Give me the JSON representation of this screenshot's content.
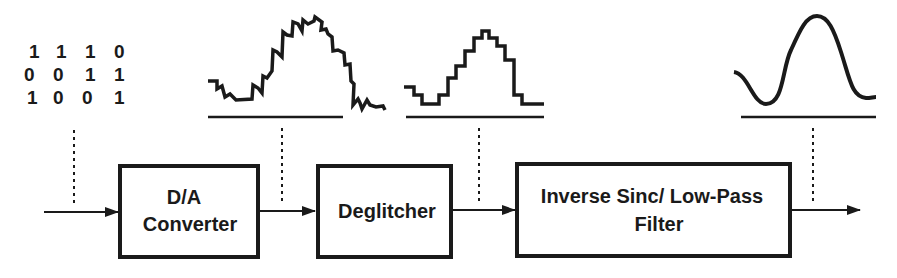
{
  "input_bits": {
    "rows": [
      [
        "1",
        "1",
        "1",
        "0"
      ],
      [
        "0",
        "0",
        "1",
        "1"
      ],
      [
        "1",
        "0",
        "0",
        "1"
      ]
    ]
  },
  "blocks": [
    {
      "id": "dac",
      "line1": "D/A",
      "line2": "Converter"
    },
    {
      "id": "deglitcher",
      "line1": "Deglitcher"
    },
    {
      "id": "filter",
      "line1": "Inverse Sinc/ Low-Pass",
      "line2": "Filter"
    }
  ],
  "waveforms": [
    {
      "id": "dac-output",
      "type": "staircase-with-glitches"
    },
    {
      "id": "deglitcher-output",
      "type": "clean-staircase"
    },
    {
      "id": "filter-output",
      "type": "smooth-analog"
    }
  ],
  "colors": {
    "ink": "#1a1a1a",
    "background": "#ffffff"
  }
}
